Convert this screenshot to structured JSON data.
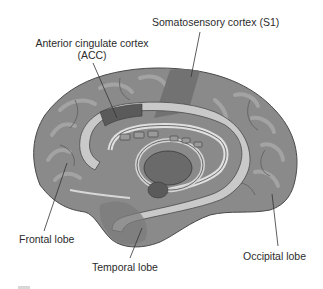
{
  "figure": {
    "type": "medial view of the brain (sagittal section)",
    "labels": [
      {
        "id": "s1",
        "text": "Somatosensory cortex (S1)"
      },
      {
        "id": "acc",
        "text": "Anterior cingulate cortex",
        "text2": "(ACC)"
      },
      {
        "id": "frontal",
        "text": "Frontal lobe"
      },
      {
        "id": "temporal",
        "text": "Temporal lobe"
      },
      {
        "id": "occipital",
        "text": "Occipital lobe"
      }
    ],
    "colors": {
      "cortex": "#8a8a8a",
      "cortex_dark": "#5e5e5e",
      "gyri_highlight": "#a8a8a8",
      "s1_region": "#6f6f6f",
      "acc_region": "#5a5a5a",
      "cingulate_light": "#c9c9c9",
      "thalamus": "#6a6a6a",
      "leader_line": "#333333",
      "text": "#2b2b2b"
    }
  }
}
